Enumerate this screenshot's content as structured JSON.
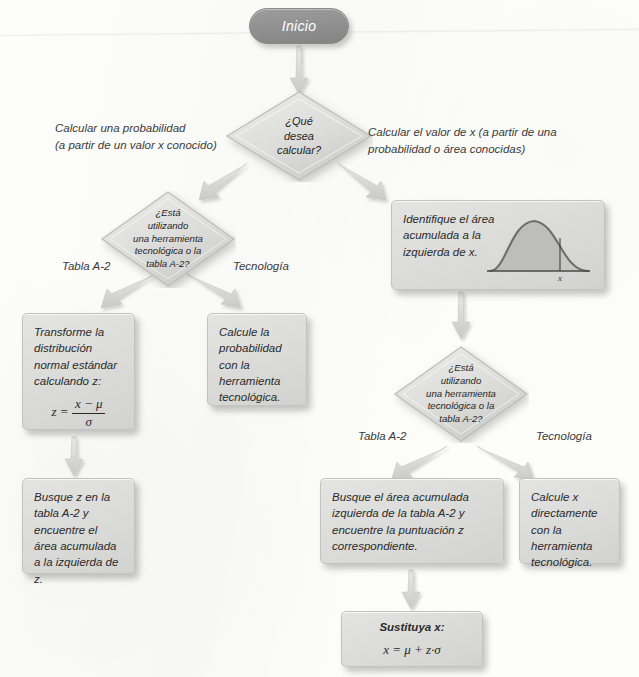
{
  "nodes": {
    "start": {
      "label": "Inicio"
    },
    "decision_main": {
      "line1": "¿Qué",
      "line2": "desea",
      "line3": "calcular?"
    },
    "decision_left": {
      "line1": "¿Está",
      "line2": "utilizando",
      "line3": "una herramienta",
      "line4": "tecnológica o la",
      "line5": "tabla A-2?"
    },
    "decision_right": {
      "line1": "¿Está",
      "line2": "utilizando",
      "line3": "una herramienta",
      "line4": "tecnológica o la",
      "line5": "tabla A-2?"
    },
    "transform_box": {
      "text": "Transforme la distribución normal estándar calculando z:",
      "formula_lhs": "z =",
      "formula_num": "x − μ",
      "formula_den": "σ"
    },
    "prob_tech_box": {
      "text": "Calcule la probabilidad con la herramienta tecnológica."
    },
    "lookup_z_box": {
      "text": "Busque z en la tabla A-2 y encuentre el área acumulada a la izquierda de z."
    },
    "identify_area_box": {
      "text": "Identifique el área acumulada a la izquierda de x.",
      "curve_axis_label": "x"
    },
    "lookup_area_box": {
      "text": "Busque el área acumulada izquierda de la tabla A-2 y encuentre la puntuación z correspondiente."
    },
    "calc_x_tech_box": {
      "text": "Calcule x directamente con la herramienta tecnológica."
    },
    "substitute_box": {
      "title": "Sustituya x:",
      "formula": "x = μ + z·σ"
    }
  },
  "edge_labels": {
    "left_branch": "Calcular una probabilidad\n(a partir de un valor x conocido)",
    "right_branch": "Calcular el valor de x (a partir de una\nprobabilidad o área conocidas)",
    "left_table": "Tabla A-2",
    "left_tech": "Tecnología",
    "right_table": "Tabla A-2",
    "right_tech": "Tecnología"
  },
  "colors": {
    "start_fill": "#8f8f8f",
    "box_fill": "#dcdcda",
    "diamond_fill": "#d6d6d4",
    "arrow_fill": "#d9d9d7",
    "text": "#2b2b2b",
    "page_bg": "#fdfdfc"
  }
}
